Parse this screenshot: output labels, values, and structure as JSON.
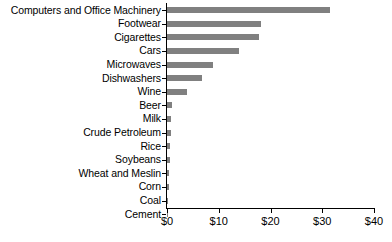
{
  "chart_data": {
    "type": "bar",
    "orientation": "horizontal",
    "title": "",
    "subtitle": "",
    "xlabel": "",
    "ylabel": "",
    "xlim": [
      0,
      40
    ],
    "grid": false,
    "legend": null,
    "bar_color": "#808080",
    "axis_color": "#000000",
    "xticks": [
      0,
      10,
      20,
      30,
      40
    ],
    "xtick_labels": [
      "$0",
      "$10",
      "$20",
      "$30",
      "$40"
    ],
    "categories": [
      "Computers and Office Machinery",
      "Footwear",
      "Cigarettes",
      "Cars",
      "Microwaves",
      "Dishwashers",
      "Wine",
      "Beer",
      "Milk",
      "Crude Petroleum",
      "Rice",
      "Soybeans",
      "Wheat and Meslin",
      "Corn",
      "Coal",
      "Cement"
    ],
    "values": [
      31.5,
      18.2,
      17.8,
      14.0,
      8.9,
      6.8,
      3.9,
      1.0,
      0.7,
      0.7,
      0.6,
      0.5,
      0.35,
      0.3,
      0.1,
      0.05
    ]
  }
}
